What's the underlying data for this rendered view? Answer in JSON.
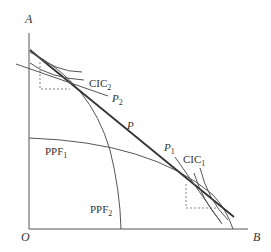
{
  "figure": {
    "axes": {
      "y_label": "A",
      "x_label": "B",
      "origin_label": "O"
    },
    "curves": {
      "ppf1": {
        "name": "PPF",
        "sub": "1"
      },
      "ppf2": {
        "name": "PPF",
        "sub": "2"
      },
      "cic1": {
        "name": "CIC",
        "sub": "1"
      },
      "cic2": {
        "name": "CIC",
        "sub": "2"
      },
      "p": {
        "name": "P"
      },
      "p1": {
        "name": "P",
        "sub": "1"
      },
      "p2": {
        "name": "P",
        "sub": "2"
      }
    },
    "colors": {
      "line": "#555555",
      "bold_line": "#333333",
      "dashed": "#666666"
    }
  }
}
